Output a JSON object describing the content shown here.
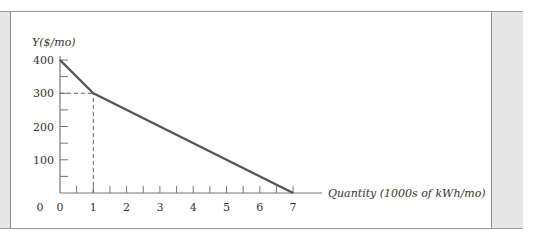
{
  "chart_data": {
    "type": "line",
    "title": "",
    "xlabel": "Quantity (1000s of kWh/mo)",
    "ylabel": "Y($/mo)",
    "xlim": [
      0,
      7
    ],
    "ylim": [
      0,
      400
    ],
    "x_ticks": [
      0,
      1,
      2,
      3,
      4,
      5,
      6,
      7
    ],
    "x_minor_ticks": [
      0.5,
      1.5,
      2.5,
      3.5,
      4.5,
      5.5,
      6.5
    ],
    "y_ticks": [
      100,
      200,
      300,
      400
    ],
    "y_minor_ticks": [
      50,
      150,
      250,
      350
    ],
    "x_tick_labels": [
      "0",
      "1",
      "2",
      "3",
      "4",
      "5",
      "6",
      "7"
    ],
    "y_tick_labels": [
      "100",
      "200",
      "300",
      "400"
    ],
    "grid": false,
    "series": [
      {
        "name": "budget constraint",
        "x": [
          0,
          1,
          7
        ],
        "y": [
          400,
          300,
          0
        ],
        "color": "#555555"
      }
    ],
    "annotations": [
      {
        "type": "dashed-guide",
        "from": [
          0,
          300
        ],
        "to": [
          1,
          300
        ]
      },
      {
        "type": "dashed-guide",
        "from": [
          1,
          0
        ],
        "to": [
          1,
          300
        ]
      }
    ]
  }
}
